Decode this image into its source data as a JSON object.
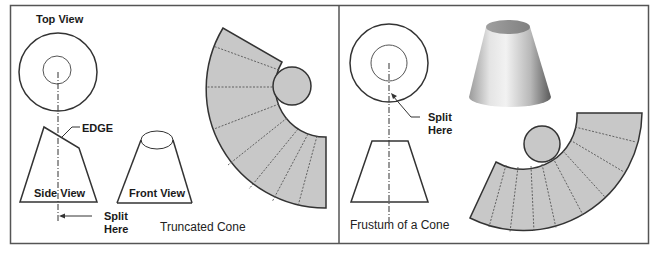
{
  "colors": {
    "frame": "#555555",
    "line": "#333333",
    "fill_gray": "#c8c8c8",
    "dash": "#555555"
  },
  "left_panel": {
    "title": "Truncated Cone",
    "top_view_label": "Top View",
    "edge_label": "EDGE",
    "side_view_label": "Side View",
    "front_view_label": "Front View",
    "split_label_line1": "Split",
    "split_label_line2": "Here",
    "pattern": {
      "radial_fold_lines": 7
    }
  },
  "right_panel": {
    "title": "Frustum of a Cone",
    "split_label_line1": "Split",
    "split_label_line2": "Here",
    "pattern": {
      "radial_fold_lines": 8
    }
  }
}
